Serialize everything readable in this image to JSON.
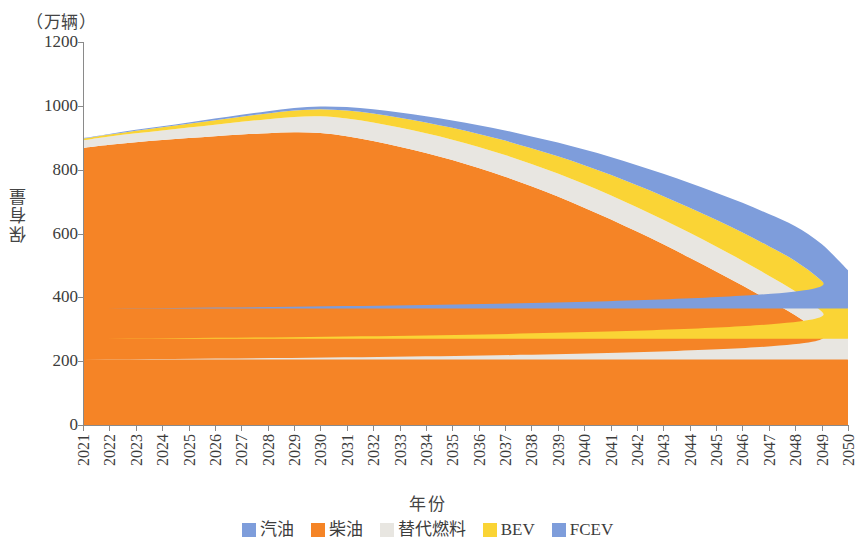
{
  "axes": {
    "y_unit": "（万辆）",
    "y_title": "保有量",
    "x_title": "年份"
  },
  "legend": {
    "items": [
      {
        "label": "汽油",
        "color": "#7e9ddb"
      },
      {
        "label": "柴油",
        "color": "#f58426"
      },
      {
        "label": "替代燃料",
        "color": "#e8e6e1"
      },
      {
        "label": "BEV",
        "color": "#fad435"
      },
      {
        "label": "FCEV",
        "color": "#7e9ddb"
      }
    ]
  },
  "chart_data": {
    "type": "area",
    "title": "",
    "xlabel": "年份",
    "ylabel": "保有量",
    "yunit": "万辆",
    "ylim": [
      0,
      1200
    ],
    "yticks": [
      0,
      200,
      400,
      600,
      800,
      1000,
      1200
    ],
    "grid": false,
    "legend_position": "bottom",
    "stacked": true,
    "categories": [
      "2021",
      "2022",
      "2023",
      "2024",
      "2025",
      "2026",
      "2027",
      "2028",
      "2029",
      "2030",
      "2031",
      "2032",
      "2033",
      "2034",
      "2035",
      "2036",
      "2037",
      "2038",
      "2039",
      "2040",
      "2041",
      "2042",
      "2043",
      "2044",
      "2045",
      "2046",
      "2047",
      "2048",
      "2049",
      "2050"
    ],
    "series": [
      {
        "name": "柴油",
        "color": "#f58426",
        "values": [
          868,
          878,
          886,
          893,
          899,
          905,
          910,
          914,
          917,
          915,
          905,
          890,
          872,
          852,
          830,
          805,
          778,
          748,
          716,
          681,
          645,
          606,
          566,
          524,
          481,
          437,
          391,
          344,
          284,
          205
        ]
      },
      {
        "name": "替代燃料",
        "color": "#e8e6e1",
        "values": [
          24,
          26,
          28,
          30,
          33,
          36,
          40,
          44,
          48,
          52,
          55,
          58,
          60,
          62,
          64,
          66,
          68,
          70,
          72,
          74,
          75,
          76,
          77,
          78,
          78,
          78,
          77,
          75,
          72,
          65
        ]
      },
      {
        "name": "BEV",
        "color": "#fad435",
        "values": [
          5,
          6,
          8,
          10,
          12,
          14,
          16,
          18,
          20,
          22,
          25,
          28,
          31,
          34,
          37,
          41,
          45,
          49,
          54,
          59,
          64,
          69,
          74,
          79,
          84,
          88,
          92,
          95,
          96,
          95
        ]
      },
      {
        "name": "汽油",
        "color": "#7e9ddb",
        "values": [
          2,
          2,
          3,
          3,
          4,
          5,
          6,
          7,
          8,
          9,
          11,
          13,
          16,
          19,
          23,
          27,
          32,
          37,
          43,
          49,
          56,
          63,
          70,
          77,
          85,
          93,
          101,
          109,
          115,
          120
        ]
      }
    ],
    "totals": [
      899,
      912,
      925,
      936,
      948,
      960,
      972,
      983,
      993,
      998,
      996,
      989,
      979,
      967,
      954,
      939,
      923,
      904,
      885,
      863,
      840,
      814,
      787,
      758,
      728,
      696,
      661,
      623,
      567,
      485
    ]
  }
}
